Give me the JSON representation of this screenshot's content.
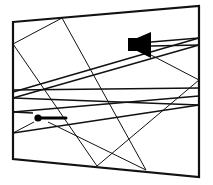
{
  "diagram": {
    "type": "acoustic-ray-tracing",
    "room": {
      "shape": "trapezoid",
      "corners": [
        [
          13,
          22
        ],
        [
          199,
          6
        ],
        [
          199,
          177
        ],
        [
          13,
          159
        ]
      ],
      "stroke_color": "#111111"
    },
    "source": {
      "kind": "speaker",
      "icon": "speaker-icon",
      "position": [
        140,
        45
      ],
      "color": "#000000"
    },
    "receiver": {
      "kind": "microphone",
      "icon": "microphone-icon",
      "position": [
        38,
        118
      ],
      "color": "#000000"
    },
    "rays": [
      {
        "from": [
          13,
          44
        ],
        "to": [
          62,
          18
        ]
      },
      {
        "from": [
          62,
          18
        ],
        "to": [
          146,
          170
        ]
      },
      {
        "from": [
          13,
          44
        ],
        "to": [
          97,
          166
        ]
      },
      {
        "from": [
          97,
          166
        ],
        "to": [
          199,
          80
        ]
      },
      {
        "from": [
          151,
          55
        ],
        "to": [
          199,
          80
        ]
      },
      {
        "from": [
          151,
          42
        ],
        "to": [
          199,
          38
        ]
      },
      {
        "from": [
          151,
          46
        ],
        "to": [
          199,
          45
        ]
      },
      {
        "from": [
          199,
          38
        ],
        "to": [
          13,
          92
        ]
      },
      {
        "from": [
          199,
          45
        ],
        "to": [
          13,
          98
        ]
      },
      {
        "from": [
          13,
          90
        ],
        "to": [
          199,
          88
        ]
      },
      {
        "from": [
          13,
          98
        ],
        "to": [
          199,
          105
        ]
      },
      {
        "from": [
          13,
          112
        ],
        "to": [
          199,
          96
        ]
      },
      {
        "from": [
          13,
          112
        ],
        "to": [
          33,
          113
        ]
      },
      {
        "from": [
          13,
          133
        ],
        "to": [
          199,
          105
        ]
      },
      {
        "from": [
          13,
          133
        ],
        "to": [
          34,
          122
        ]
      },
      {
        "from": [
          48,
          122
        ],
        "to": [
          146,
          170
        ]
      }
    ]
  }
}
